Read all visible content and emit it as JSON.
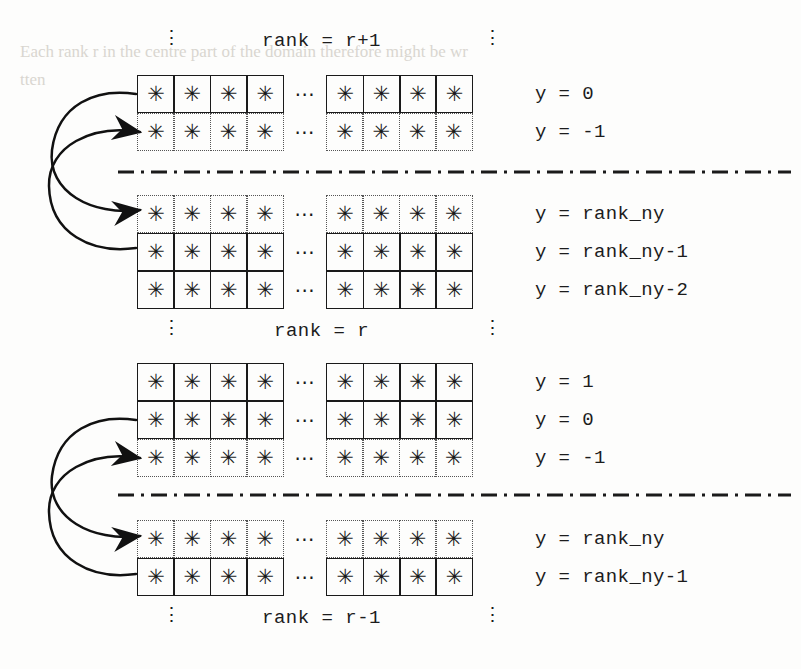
{
  "figure": {
    "cell_glyph": "✳",
    "hdots_glyph": "⋯",
    "vdots_glyph": "⋮",
    "colors": {
      "ink": "#1a1a1a",
      "halo_border": "#555555",
      "separator": "#1a1a1a",
      "ghost_text": "#d9d6d0",
      "background": "#fdfdfc"
    },
    "cells_per_group": 4,
    "groups_per_row": 2
  },
  "blocks": [
    {
      "id": "rank-r-plus-1",
      "label": "rank = r+1",
      "label_position": "top",
      "rows": [
        {
          "ylabel": "y = 0",
          "border": "solid"
        },
        {
          "ylabel": "y = -1",
          "border": "dotted"
        }
      ]
    },
    {
      "id": "rank-r-upper",
      "label": "rank = r",
      "label_position": "bottom",
      "rows": [
        {
          "ylabel": "y = rank_ny",
          "border": "dotted"
        },
        {
          "ylabel": "y = rank_ny-1",
          "border": "solid"
        },
        {
          "ylabel": "y = rank_ny-2",
          "border": "solid"
        }
      ]
    },
    {
      "id": "rank-r-lower",
      "label": "",
      "label_position": "none",
      "rows": [
        {
          "ylabel": "y = 1",
          "border": "solid"
        },
        {
          "ylabel": "y = 0",
          "border": "solid"
        },
        {
          "ylabel": "y = -1",
          "border": "dotted"
        }
      ]
    },
    {
      "id": "rank-r-minus-1",
      "label": "rank = r-1",
      "label_position": "bottom",
      "rows": [
        {
          "ylabel": "y = rank_ny",
          "border": "dotted"
        },
        {
          "ylabel": "y = rank_ny-1",
          "border": "solid"
        }
      ]
    }
  ],
  "separators": [
    {
      "id": "separator-top",
      "between": [
        "rank = r+1",
        "rank = r"
      ]
    },
    {
      "id": "separator-bottom",
      "between": [
        "rank = r",
        "rank = r-1"
      ]
    }
  ],
  "arrow_groups": [
    {
      "id": "exchange-upper",
      "description": "crossing halo exchange between rank r+1 and rank r",
      "arrows": [
        {
          "id": "send-up",
          "from_row": "y = rank_ny-1",
          "to_row": "y = -1",
          "arrowhead": true
        },
        {
          "id": "send-down",
          "from_row": "y = 0",
          "to_row": "y = rank_ny",
          "arrowhead": true
        }
      ]
    },
    {
      "id": "exchange-lower",
      "description": "crossing halo exchange between rank r and rank r-1",
      "arrows": [
        {
          "id": "send-up",
          "from_row": "y = rank_ny-1",
          "to_row": "y = -1",
          "arrowhead": true
        },
        {
          "id": "send-down",
          "from_row": "y = 0",
          "to_row": "y = rank_ny",
          "arrowhead": true
        }
      ]
    }
  ],
  "ghost_text": {
    "line1": "Each rank r in the centre part of the domain therefore might be wr",
    "line2": "tten"
  }
}
